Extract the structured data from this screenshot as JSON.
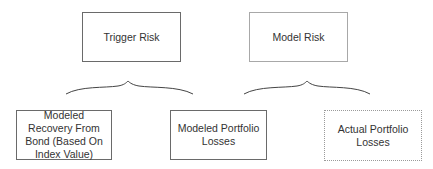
{
  "diagram": {
    "top_nodes": [
      {
        "id": "trigger-risk",
        "label": "Trigger Risk"
      },
      {
        "id": "model-risk",
        "label": "Model Risk"
      }
    ],
    "bottom_nodes": [
      {
        "id": "modeled-recovery",
        "label": "Modeled Recovery From Bond (Based On Index Value)"
      },
      {
        "id": "modeled-losses",
        "label": "Modeled Portfolio Losses"
      },
      {
        "id": "actual-losses",
        "label": "Actual Portfolio Losses"
      }
    ],
    "braces": [
      {
        "from": "trigger-risk",
        "spans": [
          "modeled-recovery",
          "modeled-losses"
        ]
      },
      {
        "from": "model-risk",
        "spans": [
          "modeled-losses",
          "actual-losses"
        ]
      }
    ]
  }
}
